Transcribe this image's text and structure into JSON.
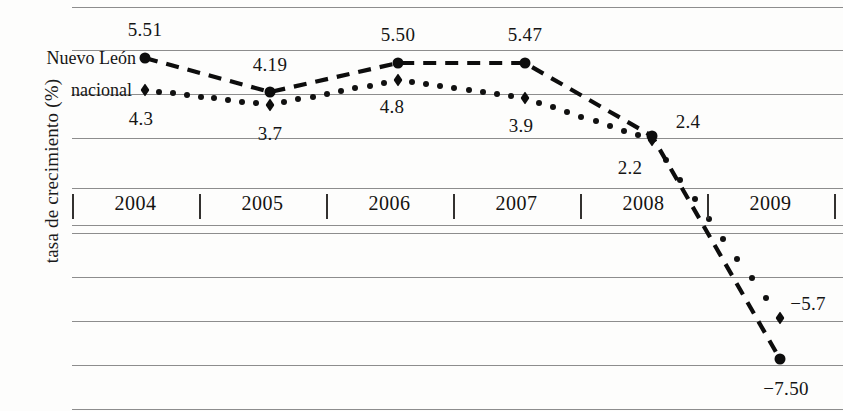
{
  "axis": {
    "y_title": "tasa de crecimiento (%)",
    "years": [
      "2004",
      "2005",
      "2006",
      "2007",
      "2008",
      "2009"
    ]
  },
  "legend": [
    {
      "name": "nuevo-leon",
      "label": "Nuevo León",
      "marker": "circle"
    },
    {
      "name": "nacional",
      "label": "nacional",
      "marker": "diamond"
    }
  ],
  "labels": {
    "nuevo_leon": [
      "5.51",
      "4.19",
      "5.50",
      "5.47",
      "2.4",
      "−7.50"
    ],
    "nacional": [
      "4.3",
      "3.7",
      "4.8",
      "3.9",
      "2.2",
      "−5.7"
    ]
  },
  "chart_data": {
    "type": "line",
    "title": "",
    "xlabel": "",
    "ylabel": "tasa de crecimiento (%)",
    "x": [
      "2004",
      "2005",
      "2006",
      "2007",
      "2008",
      "2009"
    ],
    "grid": true,
    "legend_position": "inline-left",
    "ylim": [
      -8.5,
      7.0
    ],
    "series": [
      {
        "name": "Nuevo León",
        "marker": "circle",
        "linestyle": "dashed",
        "values": [
          5.51,
          4.19,
          5.5,
          5.47,
          2.4,
          -7.5
        ],
        "labels": [
          "5.51",
          "4.19",
          "5.50",
          "5.47",
          "2.4",
          "−7.50"
        ]
      },
      {
        "name": "nacional",
        "marker": "diamond",
        "linestyle": "dotted",
        "values": [
          4.3,
          3.7,
          4.8,
          3.9,
          2.2,
          -5.7
        ],
        "labels": [
          "4.3",
          "3.7",
          "4.8",
          "3.9",
          "2.2",
          "−5.7"
        ]
      }
    ]
  },
  "geometry": {
    "gridlines_y": [
      7,
      50,
      94,
      138,
      188,
      225,
      233,
      277,
      321,
      365,
      409
    ],
    "ticks_x": [
      72,
      199,
      326,
      453,
      580,
      707,
      834
    ],
    "points_x": [
      145,
      270,
      398,
      525,
      652,
      780
    ],
    "nl_points_y": [
      58,
      92,
      63,
      63,
      136,
      359
    ],
    "nac_points_y": [
      90,
      105,
      80,
      98,
      140,
      318
    ]
  }
}
